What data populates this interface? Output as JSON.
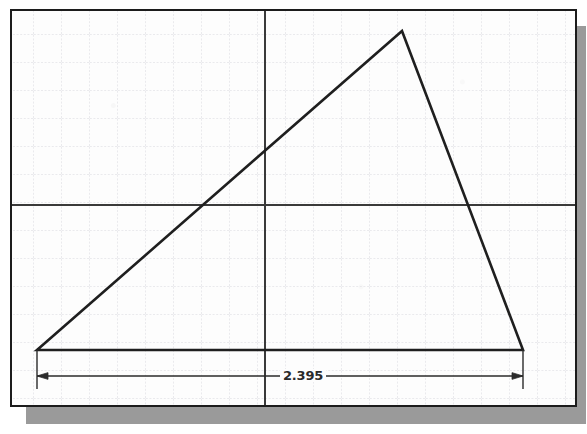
{
  "app": {
    "type": "cad-sketch-viewport",
    "background_color": "#ffffff",
    "sheet_color": "#fdfdfd",
    "shadow_color": "#9a9a9a",
    "border_color": "#1c1c1c"
  },
  "frame": {
    "x": 10,
    "y": 9,
    "width": 567,
    "height": 398,
    "border_width": 2,
    "shadow_offset_x": 16,
    "shadow_offset_y": 17
  },
  "grid": {
    "spacing": 28,
    "origin_x": 7,
    "origin_y": 5,
    "line_color": "#d7d7dd",
    "style": "dotted",
    "visible": true
  },
  "axes": {
    "color": "#3a3a3a",
    "width": 2,
    "vertical_x": 253,
    "horizontal_y": 194,
    "visible": true
  },
  "geometry": {
    "type": "triangle",
    "stroke_color": "#1f1f1f",
    "stroke_width": 2.6,
    "fill": "none",
    "vertices": [
      {
        "name": "bottom-left",
        "x": 25,
        "y": 339
      },
      {
        "name": "apex",
        "x": 390,
        "y": 20
      },
      {
        "name": "bottom-right",
        "x": 511,
        "y": 339
      }
    ]
  },
  "dimension": {
    "label": "2.395",
    "kind": "horizontal-linear",
    "line_y": 365,
    "start_x": 25,
    "end_x": 511,
    "extension_top_y": 339,
    "extension_bottom_y": 378,
    "text_x": 268,
    "text_y": 358,
    "color": "#2a2a2a",
    "arrow_style": "filled-closed-inward",
    "arrow_size": 8
  },
  "labels": {
    "viewport_title": "Sketch Viewport",
    "dimension_name": "horizontal-distance"
  }
}
